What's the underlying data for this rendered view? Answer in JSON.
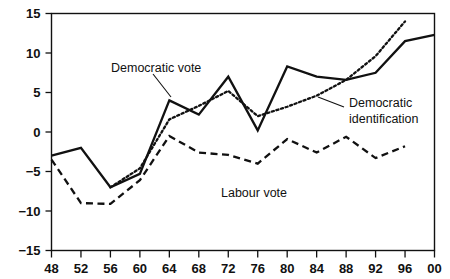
{
  "chart_data": {
    "type": "line",
    "title": "",
    "subtitle": "",
    "xlabel": "",
    "ylabel": "",
    "xlim": [
      1948,
      2000
    ],
    "ylim": [
      -15,
      15
    ],
    "grid": false,
    "legend_position": "inline-annotations",
    "x": [
      1948,
      1952,
      1956,
      1960,
      1964,
      1968,
      1972,
      1976,
      1980,
      1984,
      1988,
      1992,
      1996,
      2000
    ],
    "x_tick_labels": [
      "48",
      "52",
      "56",
      "60",
      "64",
      "68",
      "72",
      "76",
      "80",
      "84",
      "88",
      "92",
      "96",
      "00"
    ],
    "y_ticks": [
      -15,
      -10,
      -5,
      0,
      5,
      10,
      15
    ],
    "y_tick_labels": [
      "−15",
      "−10",
      "−5",
      "0",
      "5",
      "10",
      "15"
    ],
    "series": [
      {
        "name": "Democratic vote",
        "style": "solid",
        "color": "#111111",
        "x": [
          1948,
          1952,
          1956,
          1960,
          1964,
          1968,
          1972,
          1976,
          1980,
          1984,
          1988,
          1992,
          1996,
          2000
        ],
        "values": [
          -3.0,
          -2.0,
          -7.0,
          -5.3,
          4.0,
          2.2,
          7.0,
          0.2,
          8.3,
          7.0,
          6.6,
          7.5,
          11.5,
          12.3
        ]
      },
      {
        "name": "Democratic identification",
        "style": "dotted",
        "color": "#111111",
        "x": [
          1956,
          1960,
          1964,
          1968,
          1972,
          1976,
          1980,
          1984,
          1988,
          1992,
          1996
        ],
        "values": [
          -7.0,
          -4.6,
          1.6,
          3.3,
          5.2,
          2.0,
          3.2,
          4.6,
          6.6,
          9.6,
          14.0
        ]
      },
      {
        "name": "Labour vote",
        "style": "dashed",
        "color": "#111111",
        "x": [
          1948,
          1952,
          1956,
          1960,
          1964,
          1968,
          1972,
          1976,
          1980,
          1984,
          1988,
          1992,
          1996
        ],
        "values": [
          -3.5,
          -9.0,
          -9.1,
          -6.1,
          -0.5,
          -2.6,
          -2.9,
          -4.0,
          -0.9,
          -2.6,
          -0.6,
          -3.3,
          -1.8
        ]
      }
    ],
    "annotations": [
      {
        "name": "democratic-vote",
        "text": "Democratic vote",
        "lines": [
          "Democratic vote"
        ]
      },
      {
        "name": "democratic-identification",
        "text": "Democratic identification",
        "lines": [
          "Democratic",
          "identification"
        ]
      },
      {
        "name": "labour-vote",
        "text": "Labour vote",
        "lines": [
          "Labour vote"
        ]
      }
    ]
  }
}
